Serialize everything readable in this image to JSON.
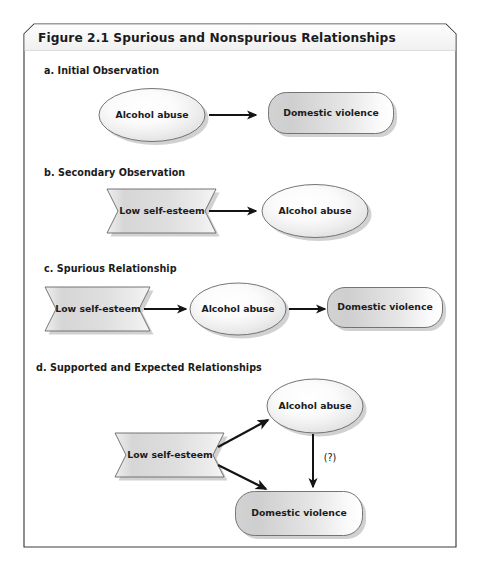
{
  "figure": {
    "title": "Figure 2.1   Spurious and Nonspurious Relationships",
    "title_label": "Figure 2.1",
    "title_body": "Spurious and Nonspurious Relationships",
    "frame_border_color": "#3c3c3c",
    "title_band_color": "#f2f2f2",
    "background_color": "#ffffff",
    "shadow_color": "#bfbfbf",
    "node_stroke_color": "#555555",
    "arrow_color": "#141414",
    "text_color": "#1b1b1b"
  },
  "sections": [
    {
      "id": "a",
      "label": "a. Initial Observation",
      "nodes": [
        {
          "id": "a-alcohol",
          "text": "Alcohol abuse",
          "shape": "ellipse"
        },
        {
          "id": "a-violence",
          "text": "Domestic violence",
          "shape": "rounded-rect"
        }
      ],
      "arrows": [
        {
          "from": "a-alcohol",
          "to": "a-violence",
          "label": ""
        }
      ]
    },
    {
      "id": "b",
      "label": "b. Secondary Observation",
      "nodes": [
        {
          "id": "b-esteem",
          "text": "Low self-esteem",
          "shape": "banner"
        },
        {
          "id": "b-alcohol",
          "text": "Alcohol abuse",
          "shape": "ellipse"
        }
      ],
      "arrows": [
        {
          "from": "b-esteem",
          "to": "b-alcohol",
          "label": ""
        }
      ]
    },
    {
      "id": "c",
      "label": "c. Spurious Relationship",
      "nodes": [
        {
          "id": "c-esteem",
          "text": "Low self-esteem",
          "shape": "banner"
        },
        {
          "id": "c-alcohol",
          "text": "Alcohol abuse",
          "shape": "ellipse"
        },
        {
          "id": "c-violence",
          "text": "Domestic violence",
          "shape": "rounded-rect"
        }
      ],
      "arrows": [
        {
          "from": "c-esteem",
          "to": "c-alcohol",
          "label": ""
        },
        {
          "from": "c-alcohol",
          "to": "c-violence",
          "label": ""
        }
      ]
    },
    {
      "id": "d",
      "label": "d. Supported and Expected Relationships",
      "nodes": [
        {
          "id": "d-esteem",
          "text": "Low self-esteem",
          "shape": "banner"
        },
        {
          "id": "d-alcohol",
          "text": "Alcohol abuse",
          "shape": "ellipse"
        },
        {
          "id": "d-violence",
          "text": "Domestic violence",
          "shape": "rounded-rect"
        }
      ],
      "arrows": [
        {
          "from": "d-esteem",
          "to": "d-alcohol",
          "label": ""
        },
        {
          "from": "d-esteem",
          "to": "d-violence",
          "label": ""
        },
        {
          "from": "d-alcohol",
          "to": "d-violence",
          "label": "(?)"
        }
      ]
    }
  ],
  "labels": {
    "uncertain_marker": "(?)"
  }
}
